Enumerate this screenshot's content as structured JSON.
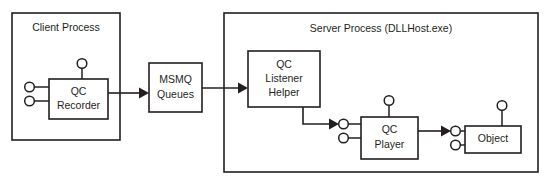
{
  "diagram": {
    "title_alt": "Queued Components architecture",
    "colors": {
      "stroke": "#231f20",
      "fill": "#ffffff",
      "background": "#ffffff"
    },
    "containers": [
      {
        "id": "client-process",
        "label": "Client Process"
      },
      {
        "id": "server-process",
        "label": "Server Process (DLLHost.exe)"
      }
    ],
    "nodes": [
      {
        "id": "qc-recorder",
        "label_line1": "QC",
        "label_line2": "Recorder"
      },
      {
        "id": "msmq-queues",
        "label_line1": "MSMQ",
        "label_line2": "Queues"
      },
      {
        "id": "qc-listener-helper",
        "label_line1": "QC",
        "label_line2": "Listener",
        "label_line3": "Helper"
      },
      {
        "id": "qc-player",
        "label_line1": "QC",
        "label_line2": "Player"
      },
      {
        "id": "object",
        "label_line1": "Object"
      }
    ],
    "connections": [
      {
        "id": "recorder-to-msmq",
        "from": "qc-recorder",
        "to": "msmq-queues",
        "type": "arrow"
      },
      {
        "id": "msmq-to-listener",
        "from": "msmq-queues",
        "to": "qc-listener-helper",
        "type": "arrow"
      },
      {
        "id": "listener-to-player",
        "from": "qc-listener-helper",
        "to": "qc-player",
        "type": "elbow-arrow"
      },
      {
        "id": "player-to-object",
        "from": "qc-player",
        "to": "object",
        "type": "arrow"
      }
    ],
    "interface_lollipops": [
      {
        "id": "recorder-interface-top",
        "owner": "qc-recorder",
        "side": "top"
      },
      {
        "id": "recorder-interface-left-upper",
        "owner": "qc-recorder",
        "side": "left"
      },
      {
        "id": "recorder-interface-left-lower",
        "owner": "qc-recorder",
        "side": "left"
      },
      {
        "id": "player-interface-top",
        "owner": "qc-player",
        "side": "top"
      },
      {
        "id": "player-interface-left-upper",
        "owner": "qc-player",
        "side": "left"
      },
      {
        "id": "player-interface-left-lower",
        "owner": "qc-player",
        "side": "left"
      },
      {
        "id": "object-interface-top",
        "owner": "object",
        "side": "top"
      },
      {
        "id": "object-interface-left-upper",
        "owner": "object",
        "side": "left"
      },
      {
        "id": "object-interface-left-lower",
        "owner": "object",
        "side": "left"
      }
    ]
  }
}
